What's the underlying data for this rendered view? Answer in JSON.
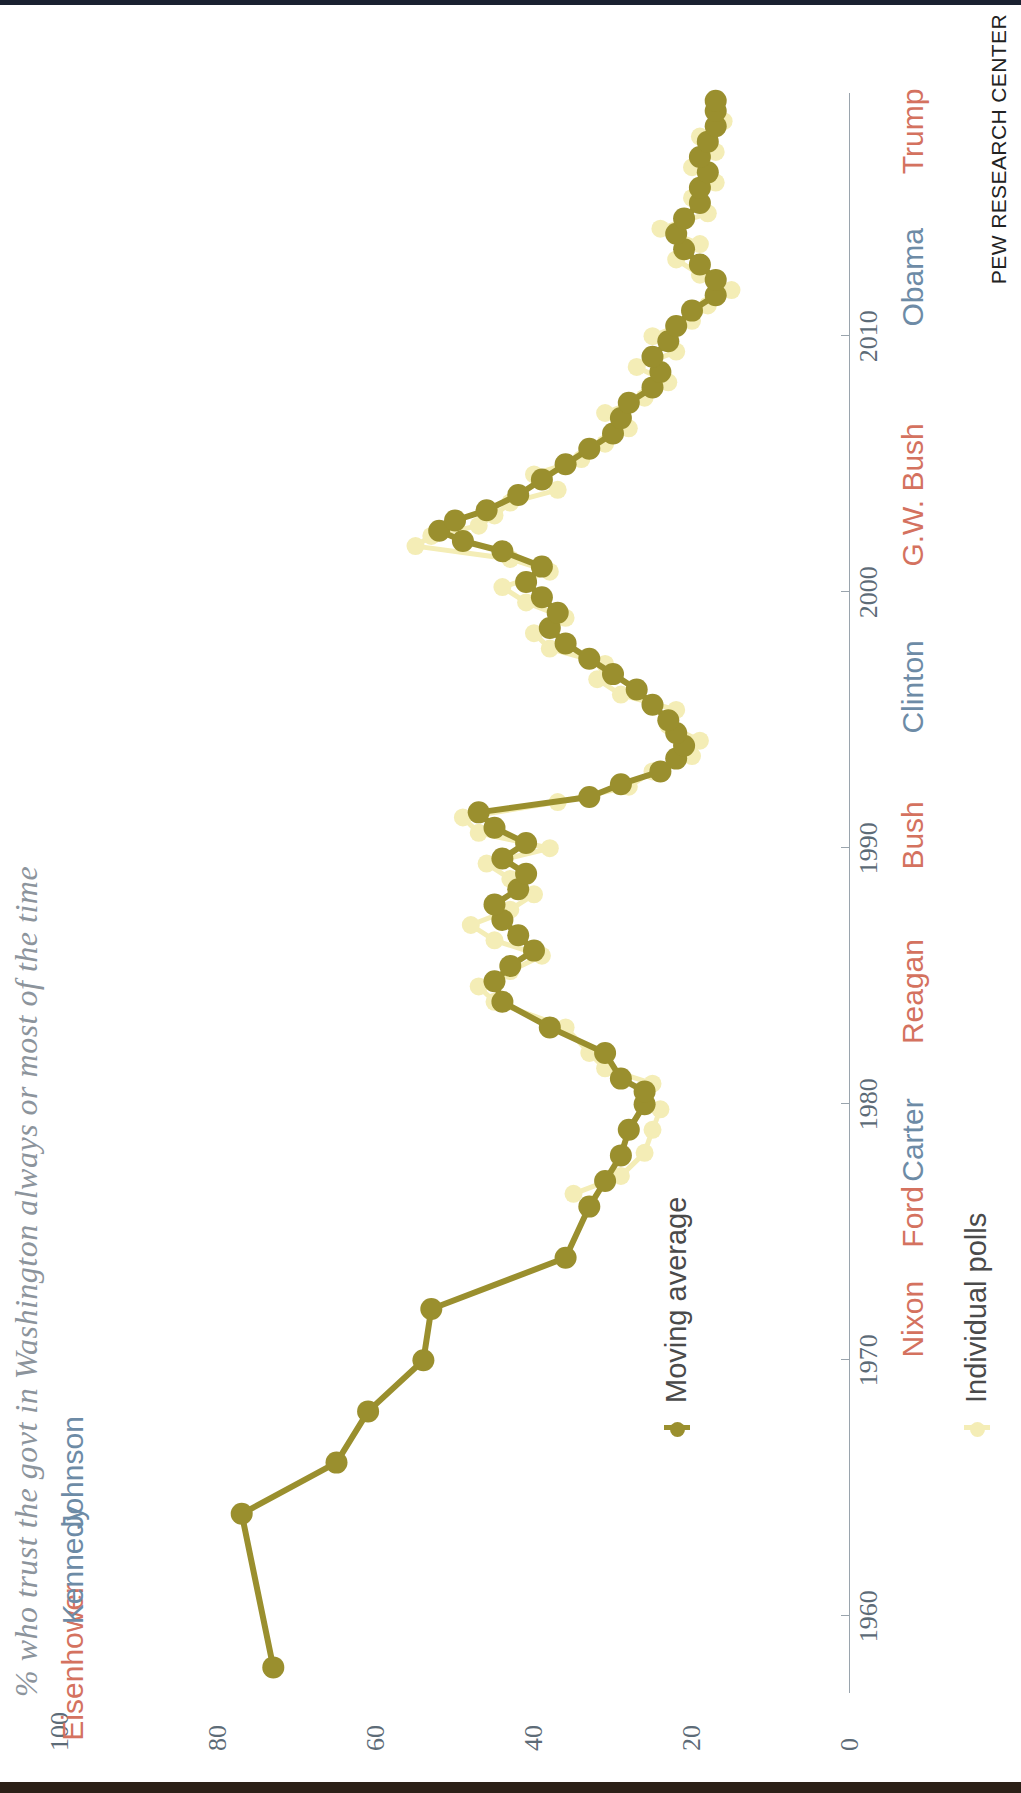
{
  "title": "% who trust the govt in Washington always or most of the time",
  "source": "PEW RESEARCH CENTER",
  "legend": {
    "moving_average_label": "Moving average",
    "individual_polls_label": "Individual polls",
    "moving_average_color": "#9a8f2e",
    "individual_polls_color": "#f4edb6"
  },
  "colors": {
    "republican": "#d4725f",
    "democrat": "#6d8ba6",
    "axis": "#9aa4ad",
    "tick_text": "#5d6b77",
    "title": "#8c949c",
    "source": "#222222"
  },
  "presidents": [
    {
      "name": "Eisenhower",
      "party": "rep",
      "year": 1958.2,
      "side": "top"
    },
    {
      "name": "Kennedy",
      "party": "dem",
      "year": 1962.0,
      "side": "top"
    },
    {
      "name": "Johnson",
      "party": "dem",
      "year": 1965.6,
      "side": "top"
    },
    {
      "name": "Nixon",
      "party": "rep",
      "year": 1971.6,
      "side": "bottom"
    },
    {
      "name": "Ford",
      "party": "rep",
      "year": 1975.6,
      "side": "bottom"
    },
    {
      "name": "Carter",
      "party": "dem",
      "year": 1978.6,
      "side": "bottom"
    },
    {
      "name": "Reagan",
      "party": "rep",
      "year": 1984.4,
      "side": "bottom"
    },
    {
      "name": "Bush",
      "party": "rep",
      "year": 1990.5,
      "side": "bottom"
    },
    {
      "name": "Clinton",
      "party": "dem",
      "year": 1996.3,
      "side": "bottom"
    },
    {
      "name": "G.W. Bush",
      "party": "rep",
      "year": 2003.8,
      "side": "bottom"
    },
    {
      "name": "Obama",
      "party": "dem",
      "year": 2012.3,
      "side": "bottom"
    },
    {
      "name": "Trump",
      "party": "rep",
      "year": 2018.0,
      "side": "bottom"
    }
  ],
  "chart_data": {
    "type": "line",
    "title": "% who trust the govt in Washington always or most of the time",
    "xlabel": "",
    "ylabel": "",
    "xlim": [
      1957,
      2019.5
    ],
    "ylim": [
      0,
      100
    ],
    "xticks": [
      1960,
      1970,
      1980,
      1990,
      2000,
      2010
    ],
    "yticks": [
      0,
      20,
      40,
      60,
      80,
      100
    ],
    "grid": false,
    "legend_position": "inside-left",
    "series": [
      {
        "name": "Moving average",
        "color": "#9a8f2e",
        "marker": "circle",
        "points": [
          [
            1958.0,
            73
          ],
          [
            1964.0,
            77
          ],
          [
            1966.0,
            65
          ],
          [
            1968.0,
            61
          ],
          [
            1970.0,
            54
          ],
          [
            1972.0,
            53
          ],
          [
            1974.0,
            36
          ],
          [
            1976.0,
            33
          ],
          [
            1977.0,
            31
          ],
          [
            1978.0,
            29
          ],
          [
            1979.0,
            28
          ],
          [
            1980.0,
            26
          ],
          [
            1980.5,
            26
          ],
          [
            1981.0,
            29
          ],
          [
            1982.0,
            31
          ],
          [
            1983.0,
            38
          ],
          [
            1984.0,
            44
          ],
          [
            1984.8,
            45
          ],
          [
            1985.4,
            43
          ],
          [
            1986.0,
            40
          ],
          [
            1986.6,
            42
          ],
          [
            1987.2,
            44
          ],
          [
            1987.8,
            45
          ],
          [
            1988.4,
            42
          ],
          [
            1989.0,
            41
          ],
          [
            1989.6,
            44
          ],
          [
            1990.2,
            41
          ],
          [
            1990.8,
            45
          ],
          [
            1991.4,
            47
          ],
          [
            1992.0,
            33
          ],
          [
            1992.5,
            29
          ],
          [
            1993.0,
            24
          ],
          [
            1993.5,
            22
          ],
          [
            1994.0,
            21
          ],
          [
            1994.5,
            22
          ],
          [
            1995.0,
            23
          ],
          [
            1995.6,
            25
          ],
          [
            1996.2,
            27
          ],
          [
            1996.8,
            30
          ],
          [
            1997.4,
            33
          ],
          [
            1998.0,
            36
          ],
          [
            1998.6,
            38
          ],
          [
            1999.2,
            37
          ],
          [
            1999.8,
            39
          ],
          [
            2000.4,
            41
          ],
          [
            2001.0,
            39
          ],
          [
            2001.6,
            44
          ],
          [
            2002.0,
            49
          ],
          [
            2002.4,
            52
          ],
          [
            2002.8,
            50
          ],
          [
            2003.2,
            46
          ],
          [
            2003.8,
            42
          ],
          [
            2004.4,
            39
          ],
          [
            2005.0,
            36
          ],
          [
            2005.6,
            33
          ],
          [
            2006.2,
            30
          ],
          [
            2006.8,
            29
          ],
          [
            2007.4,
            28
          ],
          [
            2008.0,
            25
          ],
          [
            2008.6,
            24
          ],
          [
            2009.2,
            25
          ],
          [
            2009.8,
            23
          ],
          [
            2010.4,
            22
          ],
          [
            2011.0,
            20
          ],
          [
            2011.6,
            17
          ],
          [
            2012.2,
            17
          ],
          [
            2012.8,
            19
          ],
          [
            2013.4,
            21
          ],
          [
            2014.0,
            22
          ],
          [
            2014.6,
            21
          ],
          [
            2015.2,
            19
          ],
          [
            2015.8,
            19
          ],
          [
            2016.4,
            18
          ],
          [
            2017.0,
            19
          ],
          [
            2017.6,
            18
          ],
          [
            2018.2,
            17
          ],
          [
            2018.8,
            17
          ],
          [
            2019.2,
            17
          ]
        ]
      },
      {
        "name": "Individual polls",
        "color": "#f4edb6",
        "marker": "circle",
        "points": [
          [
            1976.5,
            35
          ],
          [
            1977.2,
            29
          ],
          [
            1978.1,
            26
          ],
          [
            1979.0,
            25
          ],
          [
            1979.8,
            24
          ],
          [
            1980.2,
            26
          ],
          [
            1980.8,
            25
          ],
          [
            1981.4,
            31
          ],
          [
            1982.0,
            33
          ],
          [
            1983.0,
            36
          ],
          [
            1984.0,
            45
          ],
          [
            1984.6,
            47
          ],
          [
            1985.2,
            43
          ],
          [
            1985.8,
            39
          ],
          [
            1986.4,
            45
          ],
          [
            1987.0,
            48
          ],
          [
            1987.6,
            43
          ],
          [
            1988.2,
            40
          ],
          [
            1988.8,
            43
          ],
          [
            1989.4,
            46
          ],
          [
            1990.0,
            38
          ],
          [
            1990.6,
            47
          ],
          [
            1991.2,
            49
          ],
          [
            1991.8,
            37
          ],
          [
            1992.4,
            28
          ],
          [
            1993.0,
            25
          ],
          [
            1993.6,
            20
          ],
          [
            1994.2,
            19
          ],
          [
            1994.8,
            23
          ],
          [
            1995.4,
            22
          ],
          [
            1996.0,
            29
          ],
          [
            1996.6,
            32
          ],
          [
            1997.2,
            31
          ],
          [
            1997.8,
            38
          ],
          [
            1998.4,
            40
          ],
          [
            1999.0,
            36
          ],
          [
            1999.6,
            41
          ],
          [
            2000.2,
            44
          ],
          [
            2000.8,
            38
          ],
          [
            2001.3,
            43
          ],
          [
            2001.8,
            55
          ],
          [
            2002.2,
            53
          ],
          [
            2002.6,
            47
          ],
          [
            2003.0,
            45
          ],
          [
            2003.5,
            43
          ],
          [
            2004.0,
            37
          ],
          [
            2004.6,
            40
          ],
          [
            2005.2,
            34
          ],
          [
            2005.8,
            31
          ],
          [
            2006.4,
            28
          ],
          [
            2007.0,
            31
          ],
          [
            2007.6,
            26
          ],
          [
            2008.2,
            23
          ],
          [
            2008.8,
            27
          ],
          [
            2009.4,
            22
          ],
          [
            2010.0,
            25
          ],
          [
            2010.6,
            20
          ],
          [
            2011.2,
            18
          ],
          [
            2011.8,
            15
          ],
          [
            2012.4,
            19
          ],
          [
            2013.0,
            22
          ],
          [
            2013.6,
            19
          ],
          [
            2014.2,
            24
          ],
          [
            2014.8,
            18
          ],
          [
            2015.4,
            20
          ],
          [
            2016.0,
            17
          ],
          [
            2016.6,
            20
          ],
          [
            2017.2,
            17
          ],
          [
            2017.8,
            19
          ],
          [
            2018.4,
            16
          ],
          [
            2019.0,
            17
          ]
        ]
      }
    ]
  }
}
